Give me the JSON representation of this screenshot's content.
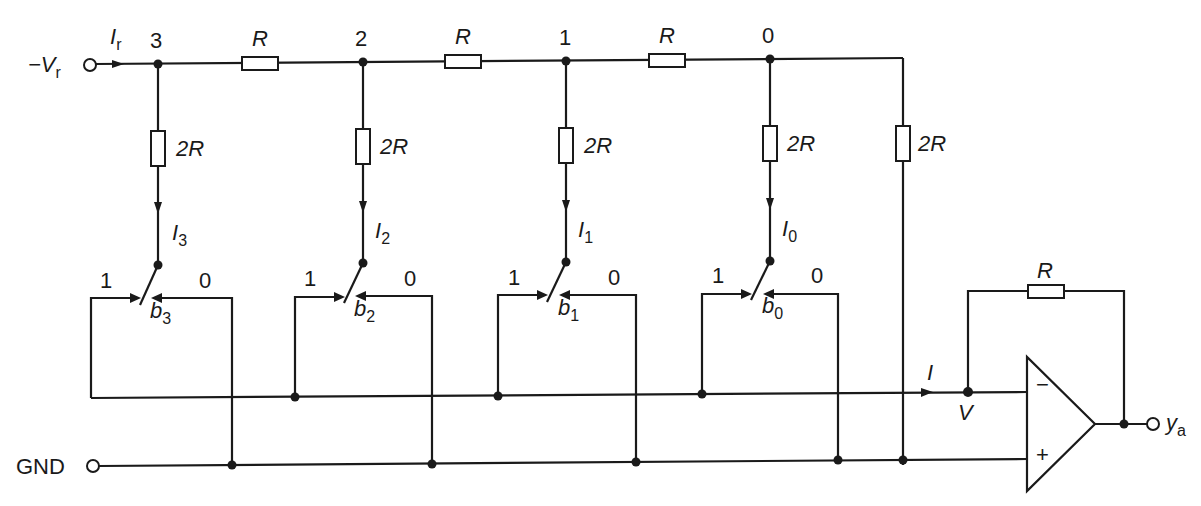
{
  "diagram": {
    "type": "R-2R ladder digital-to-analog converter",
    "colors": {
      "line": "#1a1a1a",
      "background": "#ffffff"
    },
    "input": {
      "label": "−V",
      "sub": "r",
      "current_label": "I",
      "current_sub": "r"
    },
    "ground": {
      "label": "GND"
    },
    "nodes": [
      {
        "id": "3",
        "label": "3"
      },
      {
        "id": "2",
        "label": "2"
      },
      {
        "id": "1",
        "label": "1"
      },
      {
        "id": "0",
        "label": "0"
      }
    ],
    "series_resistors": [
      {
        "label": "R"
      },
      {
        "label": "R"
      },
      {
        "label": "R"
      }
    ],
    "shunt_resistors": [
      {
        "label": "2R"
      },
      {
        "label": "2R"
      },
      {
        "label": "2R"
      },
      {
        "label": "2R"
      },
      {
        "label": "2R"
      }
    ],
    "branch_currents": [
      {
        "label": "I",
        "sub": "3"
      },
      {
        "label": "I",
        "sub": "2"
      },
      {
        "label": "I",
        "sub": "1"
      },
      {
        "label": "I",
        "sub": "0"
      }
    ],
    "switches": [
      {
        "bit": "b",
        "sub": "3",
        "pos_one": "1",
        "pos_zero": "0"
      },
      {
        "bit": "b",
        "sub": "2",
        "pos_one": "1",
        "pos_zero": "0"
      },
      {
        "bit": "b",
        "sub": "1",
        "pos_one": "1",
        "pos_zero": "0"
      },
      {
        "bit": "b",
        "sub": "0",
        "pos_one": "1",
        "pos_zero": "0"
      }
    ],
    "summing": {
      "current_label": "I",
      "node_label": "V"
    },
    "opamp": {
      "minus": "−",
      "plus": "+",
      "feedback_label": "R"
    },
    "output": {
      "label": "y",
      "sub": "a"
    }
  }
}
